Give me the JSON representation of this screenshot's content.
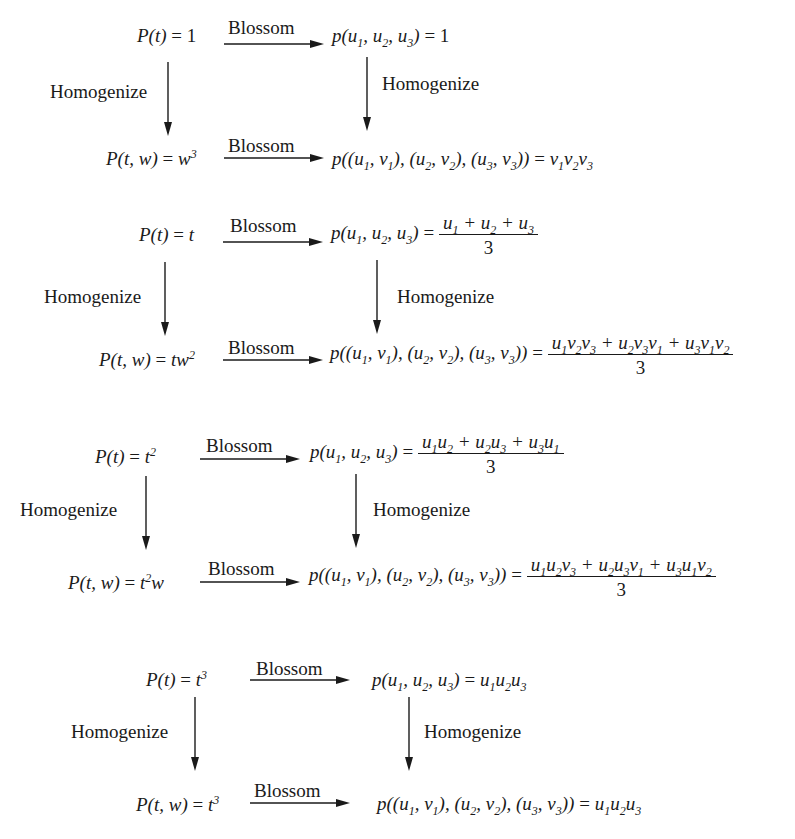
{
  "diagram": {
    "arrow_labels": {
      "horizontal": "Blossom",
      "vertical": "Homogenize"
    },
    "colors": {
      "ink": "#1a1a1a",
      "background": "#ffffff"
    },
    "blocks": [
      {
        "top_left": {
          "lhs": "P(t)",
          "rhs": "1"
        },
        "top_right": {
          "lhs": "p(u1, u2, u3)",
          "rhs": "1"
        },
        "bottom_left": {
          "lhs": "P(t, w)",
          "rhs": "w^3"
        },
        "bottom_right": {
          "lhs": "p((u1, v1), (u2, v2), (u3, v3))",
          "rhs": "v1 v2 v3"
        }
      },
      {
        "top_left": {
          "lhs": "P(t)",
          "rhs": "t"
        },
        "top_right": {
          "lhs": "p(u1, u2, u3)",
          "rhs_num": "u1 + u2 + u3",
          "rhs_den": "3"
        },
        "bottom_left": {
          "lhs": "P(t, w)",
          "rhs": "t w^2"
        },
        "bottom_right": {
          "lhs": "p((u1, v1), (u2, v2), (u3, v3))",
          "rhs_num": "u1 v2 v3 + u2 v3 v1 + u3 v1 v2",
          "rhs_den": "3"
        }
      },
      {
        "top_left": {
          "lhs": "P(t)",
          "rhs": "t^2"
        },
        "top_right": {
          "lhs": "p(u1, u2, u3)",
          "rhs_num": "u1 u2 + u2 u3 + u3 u1",
          "rhs_den": "3"
        },
        "bottom_left": {
          "lhs": "P(t, w)",
          "rhs": "t^2 w"
        },
        "bottom_right": {
          "lhs": "p((u1, v1), (u2, v2), (u3, v3))",
          "rhs_num": "u1 u2 v3 + u2 u3 v1 + u3 u1 v2",
          "rhs_den": "3"
        }
      },
      {
        "top_left": {
          "lhs": "P(t)",
          "rhs": "t^3"
        },
        "top_right": {
          "lhs": "p(u1, u2, u3)",
          "rhs": "u1 u2 u3"
        },
        "bottom_left": {
          "lhs": "P(t, w)",
          "rhs": "t^3"
        },
        "bottom_right": {
          "lhs": "p((u1, v1), (u2, v2), (u3, v3))",
          "rhs": "u1 u2 u3"
        }
      }
    ]
  }
}
